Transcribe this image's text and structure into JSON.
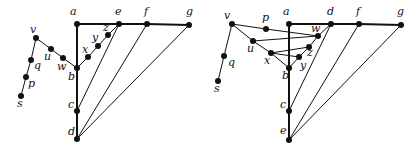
{
  "figure": {
    "width": 418,
    "height": 152,
    "colors": {
      "ink": "#111111",
      "background": "#ffffff"
    }
  },
  "graphs": [
    {
      "name": "left-graph",
      "nodes": [
        {
          "id": "a",
          "x": 77,
          "y": 24,
          "lx": 70,
          "ly": 15
        },
        {
          "id": "e",
          "x": 119,
          "y": 24,
          "lx": 115,
          "ly": 15
        },
        {
          "id": "f",
          "x": 147,
          "y": 24,
          "lx": 144,
          "ly": 15
        },
        {
          "id": "g",
          "x": 189,
          "y": 25,
          "lx": 186,
          "ly": 15
        },
        {
          "id": "z",
          "x": 108,
          "y": 35,
          "lx": 103,
          "ly": 31
        },
        {
          "id": "y",
          "x": 98,
          "y": 46,
          "lx": 92,
          "ly": 41
        },
        {
          "id": "x",
          "x": 88,
          "y": 57,
          "lx": 82,
          "ly": 53
        },
        {
          "id": "b",
          "x": 77,
          "y": 68,
          "lx": 68,
          "ly": 80
        },
        {
          "id": "w",
          "x": 63,
          "y": 58,
          "lx": 57,
          "ly": 70
        },
        {
          "id": "u",
          "x": 51,
          "y": 49,
          "lx": 44,
          "ly": 60
        },
        {
          "id": "v",
          "x": 36,
          "y": 38,
          "lx": 30,
          "ly": 33
        },
        {
          "id": "q",
          "x": 31,
          "y": 60,
          "lx": 34,
          "ly": 69
        },
        {
          "id": "p",
          "x": 26,
          "y": 77,
          "lx": 28,
          "ly": 87
        },
        {
          "id": "s",
          "x": 21,
          "y": 96,
          "lx": 17,
          "ly": 107
        },
        {
          "id": "c",
          "x": 77,
          "y": 111,
          "lx": 68,
          "ly": 108
        },
        {
          "id": "d",
          "x": 77,
          "y": 139,
          "lx": 68,
          "ly": 135
        }
      ],
      "edges": [
        [
          "a",
          "e",
          1
        ],
        [
          "e",
          "f",
          1
        ],
        [
          "f",
          "g",
          1
        ],
        [
          "a",
          "b",
          1
        ],
        [
          "b",
          "c",
          1
        ],
        [
          "c",
          "d",
          1
        ],
        [
          "e",
          "c",
          0
        ],
        [
          "f",
          "d",
          0
        ],
        [
          "g",
          "d",
          0
        ],
        [
          "b",
          "x",
          0
        ],
        [
          "x",
          "y",
          0
        ],
        [
          "y",
          "z",
          0
        ],
        [
          "z",
          "e",
          0
        ],
        [
          "v",
          "u",
          0
        ],
        [
          "u",
          "w",
          0
        ],
        [
          "w",
          "b",
          0
        ],
        [
          "v",
          "q",
          0
        ],
        [
          "q",
          "p",
          0
        ],
        [
          "p",
          "s",
          0
        ]
      ]
    },
    {
      "name": "right-graph",
      "nodes": [
        {
          "id": "a",
          "x": 289,
          "y": 24,
          "lx": 283,
          "ly": 15
        },
        {
          "id": "d",
          "x": 331,
          "y": 24,
          "lx": 327,
          "ly": 15
        },
        {
          "id": "f",
          "x": 359,
          "y": 24,
          "lx": 356,
          "ly": 15
        },
        {
          "id": "g",
          "x": 401,
          "y": 25,
          "lx": 397,
          "ly": 15
        },
        {
          "id": "v",
          "x": 232,
          "y": 24,
          "lx": 224,
          "ly": 19
        },
        {
          "id": "p",
          "x": 266,
          "y": 29,
          "lx": 262,
          "ly": 21
        },
        {
          "id": "w",
          "x": 318,
          "y": 36,
          "lx": 311,
          "ly": 32
        },
        {
          "id": "u",
          "x": 253,
          "y": 41,
          "lx": 247,
          "ly": 52
        },
        {
          "id": "z",
          "x": 309,
          "y": 47,
          "lx": 307,
          "ly": 56
        },
        {
          "id": "x",
          "x": 271,
          "y": 53,
          "lx": 264,
          "ly": 64
        },
        {
          "id": "y",
          "x": 299,
          "y": 57,
          "lx": 300,
          "ly": 69
        },
        {
          "id": "b",
          "x": 289,
          "y": 68,
          "lx": 282,
          "ly": 79
        },
        {
          "id": "q",
          "x": 224,
          "y": 56,
          "lx": 228,
          "ly": 66
        },
        {
          "id": "s",
          "x": 218,
          "y": 81,
          "lx": 214,
          "ly": 92
        },
        {
          "id": "c",
          "x": 289,
          "y": 111,
          "lx": 280,
          "ly": 108
        },
        {
          "id": "e",
          "x": 289,
          "y": 140,
          "lx": 280,
          "ly": 134
        }
      ],
      "edges": [
        [
          "a",
          "d",
          1
        ],
        [
          "d",
          "f",
          1
        ],
        [
          "f",
          "g",
          1
        ],
        [
          "a",
          "b",
          1
        ],
        [
          "b",
          "c",
          1
        ],
        [
          "c",
          "e",
          1
        ],
        [
          "d",
          "c",
          0
        ],
        [
          "f",
          "e",
          0
        ],
        [
          "g",
          "e",
          0
        ],
        [
          "d",
          "w",
          0
        ],
        [
          "v",
          "p",
          0
        ],
        [
          "p",
          "w",
          0
        ],
        [
          "v",
          "u",
          0
        ],
        [
          "u",
          "w",
          0
        ],
        [
          "u",
          "x",
          0
        ],
        [
          "x",
          "b",
          0
        ],
        [
          "x",
          "z",
          0
        ],
        [
          "x",
          "y",
          0
        ],
        [
          "b",
          "y",
          0
        ],
        [
          "w",
          "z",
          0
        ],
        [
          "z",
          "y",
          0
        ],
        [
          "v",
          "q",
          0
        ],
        [
          "q",
          "s",
          0
        ]
      ]
    }
  ]
}
